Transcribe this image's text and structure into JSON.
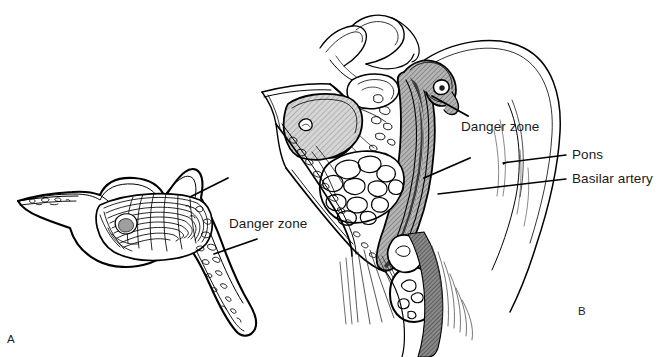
{
  "figure": {
    "type": "anatomical-line-illustration",
    "background_color": "#ffffff",
    "ink_color": "#000000",
    "shading_colors": {
      "sinus_mucosa_gray": "#c9c9c9",
      "bone_gray": "#9a9a9a",
      "dark_gray": "#6e6e6e"
    },
    "width": 672,
    "height": 357
  },
  "panels": [
    {
      "id": "A",
      "letter": "A",
      "caption_letter": "A",
      "view": "isolated sphenoid bone cross-section",
      "labels": [
        {
          "id": "danger-zone-a",
          "text": "Danger zone",
          "leader_lines": 2
        }
      ]
    },
    {
      "id": "B",
      "letter": "B",
      "caption_letter": "B",
      "view": "midsagittal head section through nasal cavity, sphenoid sinus, clivus and brainstem",
      "labels": [
        {
          "id": "danger-zone-b",
          "text": "Danger zone",
          "leader_lines": 2
        },
        {
          "id": "pons",
          "text": "Pons",
          "leader_lines": 1
        },
        {
          "id": "basilar-artery",
          "text": "Basilar artery",
          "leader_lines": 1
        }
      ]
    }
  ],
  "labels": {
    "danger_zone_a": "Danger zone",
    "danger_zone_b": "Danger zone",
    "pons": "Pons",
    "basilar_artery": "Basilar artery",
    "panel_a": "A",
    "panel_b": "B"
  }
}
